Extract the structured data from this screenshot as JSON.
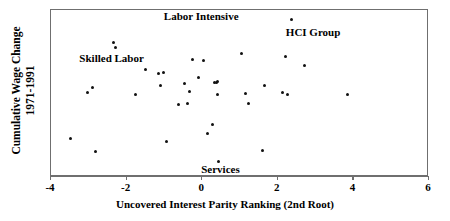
{
  "chart_data": {
    "type": "scatter",
    "title": "",
    "xlabel": "Uncovered Interest Parity Ranking (2nd Root)",
    "ylabel": "Cumulative Wage Change 1971-1991",
    "ylabel_line1": "Cumulative Wage Change",
    "ylabel_line2": "1971-1991",
    "xlim": [
      -4,
      6
    ],
    "ylim": [
      0,
      1
    ],
    "xticks": [
      -4,
      -2,
      0,
      2,
      4,
      6
    ],
    "xticklabels": [
      "-4",
      "-2",
      "0",
      "2",
      "4",
      "6"
    ],
    "yticks": [],
    "yticklabels": [],
    "grid": false,
    "legend": "none",
    "marker_color": "#111111",
    "frame_color": "#6f6f6f",
    "series": [
      {
        "name": "industries",
        "points": [
          {
            "x": -3.47,
            "y": 0.223
          },
          {
            "x": -3.01,
            "y": 0.503
          },
          {
            "x": -2.87,
            "y": 0.528
          },
          {
            "x": -2.8,
            "y": 0.146
          },
          {
            "x": -2.33,
            "y": 0.8
          },
          {
            "x": -2.26,
            "y": 0.768
          },
          {
            "x": -1.73,
            "y": 0.486
          },
          {
            "x": -1.47,
            "y": 0.637
          },
          {
            "x": -1.13,
            "y": 0.613
          },
          {
            "x": -1.08,
            "y": 0.54
          },
          {
            "x": -1.0,
            "y": 0.617
          },
          {
            "x": -0.93,
            "y": 0.205
          },
          {
            "x": -0.6,
            "y": 0.43
          },
          {
            "x": -0.44,
            "y": 0.551
          },
          {
            "x": -0.36,
            "y": 0.436
          },
          {
            "x": -0.3,
            "y": 0.508
          },
          {
            "x": -0.23,
            "y": 0.695
          },
          {
            "x": -0.07,
            "y": 0.59
          },
          {
            "x": 0.06,
            "y": 0.689
          },
          {
            "x": 0.16,
            "y": 0.253
          },
          {
            "x": 0.3,
            "y": 0.311
          },
          {
            "x": 0.34,
            "y": 0.56
          },
          {
            "x": 0.4,
            "y": 0.562
          },
          {
            "x": 0.42,
            "y": 0.568
          },
          {
            "x": 0.44,
            "y": 0.487
          },
          {
            "x": 0.46,
            "y": 0.088
          },
          {
            "x": 1.07,
            "y": 0.733
          },
          {
            "x": 1.18,
            "y": 0.494
          },
          {
            "x": 1.26,
            "y": 0.432
          },
          {
            "x": 1.62,
            "y": 0.153
          },
          {
            "x": 1.67,
            "y": 0.54
          },
          {
            "x": 2.14,
            "y": 0.5
          },
          {
            "x": 2.23,
            "y": 0.713
          },
          {
            "x": 2.28,
            "y": 0.487
          },
          {
            "x": 2.38,
            "y": 0.937
          },
          {
            "x": 2.74,
            "y": 0.66
          },
          {
            "x": 3.88,
            "y": 0.487
          }
        ]
      }
    ],
    "annotations": [
      {
        "text": "Labor Intensive",
        "x": 0.0,
        "y": 0.955,
        "align": "center"
      },
      {
        "text": "HCI Group",
        "x": 2.96,
        "y": 0.855,
        "align": "center"
      },
      {
        "text": "Skilled Labor",
        "x": -2.37,
        "y": 0.7,
        "align": "center"
      },
      {
        "text": "Services",
        "x": 0.51,
        "y": 0.035,
        "align": "center"
      }
    ]
  }
}
